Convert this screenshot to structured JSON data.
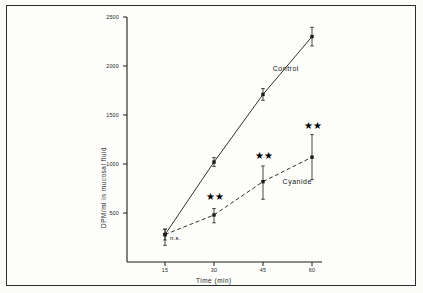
{
  "figure": {
    "background_color": "#fdfdfb",
    "frame_color": "#2b2b2b",
    "ink_color": "#1d1d1d"
  },
  "chart_data": {
    "type": "line",
    "title": "",
    "subtitle": "",
    "xlabel": "Time (min)",
    "ylabel": "DPM/ml in mucosal fluid",
    "x": [
      15,
      30,
      45,
      60
    ],
    "xtick_labels": [
      "15",
      "30",
      "45",
      "60"
    ],
    "ytick_labels": [
      "500",
      "1000",
      "1500",
      "2000",
      "2500"
    ],
    "yticks": [
      500,
      1000,
      1500,
      2000,
      2500
    ],
    "xlim": [
      7.5,
      67.5
    ],
    "ylim": [
      0,
      2500
    ],
    "grid": false,
    "legend_position": "inline-labels",
    "series": [
      {
        "name": "Control",
        "linestyle": "solid",
        "marker": "filled-square",
        "color": "#1a1a1a",
        "values": [
          280,
          1020,
          1710,
          2300
        ],
        "error_low": [
          55,
          45,
          60,
          95
        ],
        "error_high": [
          55,
          45,
          60,
          95
        ]
      },
      {
        "name": "Cyanide",
        "linestyle": "dashed",
        "marker": "filled-square",
        "color": "#1a1a1a",
        "values": [
          280,
          480,
          820,
          1070
        ],
        "error_low": [
          110,
          80,
          180,
          230
        ],
        "error_high": [
          55,
          65,
          160,
          230
        ]
      }
    ],
    "annotations": [
      {
        "text": "n.s.",
        "x": 15,
        "y": 230,
        "kind": "significance-none"
      },
      {
        "text": "★★",
        "x": 30,
        "y": 640,
        "kind": "significance-stars"
      },
      {
        "text": "★★",
        "x": 45,
        "y": 1060,
        "kind": "significance-stars"
      },
      {
        "text": "★★",
        "x": 60,
        "y": 1370,
        "kind": "significance-stars"
      }
    ],
    "series_inline_labels": [
      {
        "text": "Control",
        "x": 48,
        "y": 1960
      },
      {
        "text": "Cyanide",
        "x": 51,
        "y": 810
      }
    ]
  }
}
